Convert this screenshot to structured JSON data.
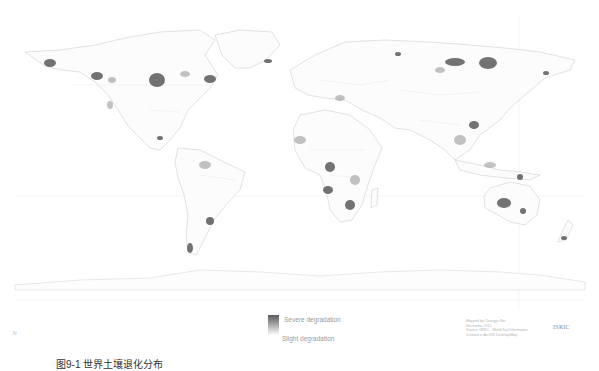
{
  "map": {
    "title": "World soil degradation (ISRIC)",
    "colors": {
      "background": "#ffffff",
      "coastline": "#c9c9c9",
      "borders": "#dedede",
      "graticule": "#ececec",
      "severe": "#555555",
      "moderate": "#8c8c8c"
    }
  },
  "legend": {
    "severe_label": "Severe degradation",
    "slight_label": "Slight degradation"
  },
  "credits": {
    "lines": [
      "Mapped by Changyu Bai",
      "November 2015",
      "Source: ISRIC - World Soil Information",
      "Created in ArcGIS Desktop/Map"
    ]
  },
  "logo": {
    "text": "ISRIC"
  },
  "corner_mark": {
    "text": "N"
  },
  "caption": {
    "text": "图9-1 世界土壤退化分布"
  }
}
